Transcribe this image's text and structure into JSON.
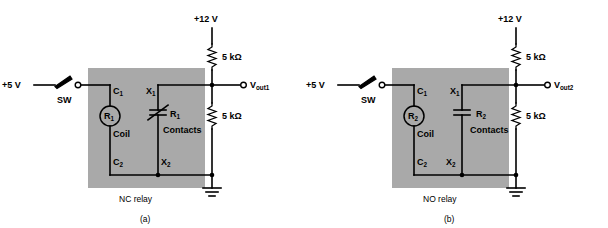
{
  "figure": {
    "width": 608,
    "height": 228,
    "background": "#ffffff",
    "relay_box_color": "#a9a9a9",
    "wire_color": "#000000"
  },
  "circuits": [
    {
      "id": "a",
      "caption": "(a)",
      "relay_label": "NC relay",
      "relay_type": "normally-closed",
      "supply_left": "+5 V",
      "supply_top": "+12 V",
      "switch_label": "SW",
      "coil_label": "Coil",
      "coil_designator": "R",
      "coil_designator_sub": "1",
      "contacts_label": "Contacts",
      "contacts_designator": "R",
      "contacts_designator_sub": "1",
      "terminal_c1": "C",
      "terminal_c1_sub": "1",
      "terminal_c2": "C",
      "terminal_c2_sub": "2",
      "terminal_x1": "X",
      "terminal_x1_sub": "1",
      "terminal_x2": "X",
      "terminal_x2_sub": "2",
      "resistor_top": "5 kΩ",
      "resistor_bottom": "5 kΩ",
      "output": "V",
      "output_sub": "out1"
    },
    {
      "id": "b",
      "caption": "(b)",
      "relay_label": "NO relay",
      "relay_type": "normally-open",
      "supply_left": "+5 V",
      "supply_top": "+12 V",
      "switch_label": "SW",
      "coil_label": "Coil",
      "coil_designator": "R",
      "coil_designator_sub": "2",
      "contacts_label": "Contacts",
      "contacts_designator": "R",
      "contacts_designator_sub": "2",
      "terminal_c1": "C",
      "terminal_c1_sub": "1",
      "terminal_c2": "C",
      "terminal_c2_sub": "2",
      "terminal_x1": "X",
      "terminal_x1_sub": "1",
      "terminal_x2": "X",
      "terminal_x2_sub": "2",
      "resistor_top": "5 kΩ",
      "resistor_bottom": "5 kΩ",
      "output": "V",
      "output_sub": "out2"
    }
  ]
}
